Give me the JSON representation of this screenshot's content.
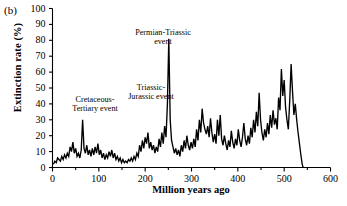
{
  "panel": {
    "label": "(b)"
  },
  "axes": {
    "ylabel": "Extinction rate (%)",
    "xlabel": "Million years ago",
    "yticks": [
      0,
      10,
      20,
      30,
      40,
      50,
      60,
      70,
      80,
      90,
      100
    ],
    "xticks": [
      0,
      100,
      200,
      300,
      400,
      500,
      600
    ],
    "xminor": [
      50,
      150,
      250,
      350,
      450,
      550
    ],
    "ylim": [
      0,
      100
    ],
    "xlim": [
      0,
      600
    ],
    "grid": false,
    "line_color": "#000000"
  },
  "annotations": [
    {
      "name": "cretaceous-tertiary",
      "line1": "Cretaceous-",
      "line2": "Tertiary event",
      "x_ma": 65,
      "y_pct": 30
    },
    {
      "name": "triassic-jurassic",
      "line1": "Triassic-",
      "line2": "Jurassic event",
      "x_ma": 208,
      "y_pct": 50
    },
    {
      "name": "permian-triassic",
      "line1": "Permian-Triassic",
      "line2": "event",
      "x_ma": 251,
      "y_pct": 81
    }
  ],
  "chart_data": {
    "type": "line",
    "title": "",
    "xlabel": "Million years ago",
    "ylabel": "Extinction rate (%)",
    "xlim": [
      0,
      600
    ],
    "ylim": [
      0,
      100
    ],
    "grid": false,
    "legend": null,
    "series": [
      {
        "name": "Extinction rate",
        "color": "#000000",
        "points": [
          [
            2,
            2
          ],
          [
            5,
            4
          ],
          [
            8,
            3
          ],
          [
            11,
            6
          ],
          [
            14,
            5
          ],
          [
            17,
            4
          ],
          [
            20,
            7
          ],
          [
            23,
            5
          ],
          [
            26,
            8
          ],
          [
            29,
            6
          ],
          [
            32,
            9
          ],
          [
            35,
            7
          ],
          [
            38,
            13
          ],
          [
            41,
            10
          ],
          [
            44,
            16
          ],
          [
            47,
            9
          ],
          [
            50,
            12
          ],
          [
            53,
            7
          ],
          [
            56,
            9
          ],
          [
            59,
            6
          ],
          [
            62,
            11
          ],
          [
            65,
            30
          ],
          [
            68,
            12
          ],
          [
            71,
            9
          ],
          [
            74,
            14
          ],
          [
            77,
            8
          ],
          [
            80,
            11
          ],
          [
            83,
            7
          ],
          [
            86,
            12
          ],
          [
            89,
            8
          ],
          [
            92,
            13
          ],
          [
            95,
            9
          ],
          [
            98,
            15
          ],
          [
            101,
            8
          ],
          [
            104,
            11
          ],
          [
            107,
            6
          ],
          [
            110,
            9
          ],
          [
            113,
            5
          ],
          [
            116,
            8
          ],
          [
            119,
            6
          ],
          [
            122,
            10
          ],
          [
            125,
            7
          ],
          [
            128,
            11
          ],
          [
            131,
            6
          ],
          [
            134,
            9
          ],
          [
            137,
            5
          ],
          [
            140,
            7
          ],
          [
            143,
            4
          ],
          [
            146,
            6
          ],
          [
            149,
            3
          ],
          [
            152,
            5
          ],
          [
            155,
            3
          ],
          [
            158,
            4
          ],
          [
            161,
            3
          ],
          [
            164,
            5
          ],
          [
            167,
            4
          ],
          [
            170,
            6
          ],
          [
            173,
            4
          ],
          [
            176,
            7
          ],
          [
            179,
            5
          ],
          [
            182,
            9
          ],
          [
            185,
            7
          ],
          [
            188,
            14
          ],
          [
            191,
            10
          ],
          [
            194,
            17
          ],
          [
            197,
            12
          ],
          [
            200,
            19
          ],
          [
            203,
            15
          ],
          [
            206,
            22
          ],
          [
            209,
            12
          ],
          [
            212,
            16
          ],
          [
            215,
            11
          ],
          [
            218,
            14
          ],
          [
            221,
            9
          ],
          [
            224,
            13
          ],
          [
            227,
            10
          ],
          [
            230,
            18
          ],
          [
            233,
            13
          ],
          [
            236,
            22
          ],
          [
            239,
            15
          ],
          [
            242,
            26
          ],
          [
            245,
            19
          ],
          [
            248,
            40
          ],
          [
            251,
            81
          ],
          [
            254,
            30
          ],
          [
            257,
            17
          ],
          [
            260,
            13
          ],
          [
            263,
            9
          ],
          [
            266,
            12
          ],
          [
            269,
            8
          ],
          [
            272,
            11
          ],
          [
            275,
            7
          ],
          [
            278,
            14
          ],
          [
            281,
            10
          ],
          [
            284,
            17
          ],
          [
            287,
            12
          ],
          [
            290,
            20
          ],
          [
            293,
            14
          ],
          [
            296,
            11
          ],
          [
            299,
            16
          ],
          [
            302,
            12
          ],
          [
            305,
            18
          ],
          [
            308,
            13
          ],
          [
            311,
            24
          ],
          [
            314,
            17
          ],
          [
            317,
            30
          ],
          [
            320,
            22
          ],
          [
            323,
            37
          ],
          [
            326,
            28
          ],
          [
            329,
            24
          ],
          [
            332,
            21
          ],
          [
            335,
            26
          ],
          [
            338,
            19
          ],
          [
            341,
            31
          ],
          [
            344,
            22
          ],
          [
            347,
            16
          ],
          [
            350,
            21
          ],
          [
            353,
            15
          ],
          [
            356,
            30
          ],
          [
            359,
            20
          ],
          [
            362,
            33
          ],
          [
            365,
            18
          ],
          [
            368,
            14
          ],
          [
            371,
            20
          ],
          [
            374,
            15
          ],
          [
            377,
            11
          ],
          [
            380,
            17
          ],
          [
            383,
            13
          ],
          [
            386,
            23
          ],
          [
            389,
            16
          ],
          [
            392,
            12
          ],
          [
            395,
            18
          ],
          [
            398,
            14
          ],
          [
            401,
            24
          ],
          [
            404,
            17
          ],
          [
            407,
            13
          ],
          [
            410,
            19
          ],
          [
            413,
            28
          ],
          [
            416,
            18
          ],
          [
            419,
            14
          ],
          [
            422,
            20
          ],
          [
            425,
            15
          ],
          [
            428,
            25
          ],
          [
            431,
            19
          ],
          [
            434,
            30
          ],
          [
            437,
            22
          ],
          [
            440,
            35
          ],
          [
            443,
            26
          ],
          [
            446,
            47
          ],
          [
            449,
            30
          ],
          [
            452,
            22
          ],
          [
            455,
            17
          ],
          [
            458,
            24
          ],
          [
            461,
            19
          ],
          [
            464,
            28
          ],
          [
            467,
            21
          ],
          [
            470,
            33
          ],
          [
            473,
            25
          ],
          [
            476,
            36
          ],
          [
            479,
            27
          ],
          [
            482,
            31
          ],
          [
            485,
            24
          ],
          [
            488,
            44
          ],
          [
            491,
            36
          ],
          [
            494,
            62
          ],
          [
            497,
            45
          ],
          [
            500,
            55
          ],
          [
            503,
            38
          ],
          [
            506,
            30
          ],
          [
            509,
            24
          ],
          [
            512,
            42
          ],
          [
            515,
            65
          ],
          [
            518,
            48
          ],
          [
            521,
            33
          ],
          [
            524,
            40
          ],
          [
            527,
            30
          ],
          [
            530,
            22
          ],
          [
            533,
            15
          ],
          [
            536,
            8
          ],
          [
            539,
            2
          ],
          [
            541,
            0
          ]
        ]
      }
    ]
  }
}
